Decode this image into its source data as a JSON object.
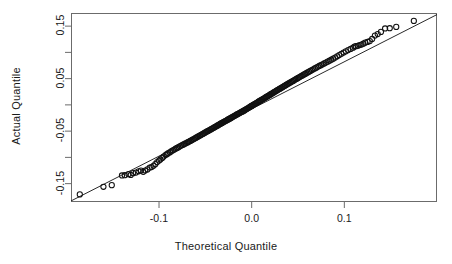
{
  "chart_data": {
    "type": "scatter",
    "title": "",
    "subtitle": "",
    "xlabel": "Theoretical Quantile",
    "ylabel": "Actual Quantile",
    "xlim": [
      -0.195,
      0.2
    ],
    "ylim": [
      -0.185,
      0.175
    ],
    "grid": false,
    "legend": null,
    "x_ticks": [
      {
        "value": -0.1,
        "label": "-0.1"
      },
      {
        "value": 0.0,
        "label": "0.0"
      },
      {
        "value": 0.1,
        "label": "0.1"
      }
    ],
    "y_ticks": [
      {
        "value": 0.15,
        "label": "0.15"
      },
      {
        "value": 0.1,
        "label": ""
      },
      {
        "value": 0.05,
        "label": "0.05"
      },
      {
        "value": 0.0,
        "label": ""
      },
      {
        "value": -0.05,
        "label": "-0.05"
      },
      {
        "value": -0.1,
        "label": ""
      },
      {
        "value": -0.15,
        "label": "-0.15"
      }
    ],
    "marker": {
      "shape": "open-circle",
      "radius": 2.6,
      "stroke": "#111111",
      "fill": "none"
    },
    "reference_line": {
      "x0": -0.195,
      "y0": -0.183,
      "x1": 0.2,
      "y1": 0.172,
      "color": "#111111",
      "width": 0.9
    },
    "series": [
      {
        "name": "quantiles",
        "points": [
          [
            -0.1855,
            -0.1705
          ],
          [
            -0.16,
            -0.156
          ],
          [
            -0.151,
            -0.153
          ],
          [
            -0.14,
            -0.1345
          ],
          [
            -0.137,
            -0.134
          ],
          [
            -0.133,
            -0.132
          ],
          [
            -0.1305,
            -0.1335
          ],
          [
            -0.128,
            -0.13
          ],
          [
            -0.125,
            -0.129
          ],
          [
            -0.122,
            -0.1265
          ],
          [
            -0.1195,
            -0.125
          ],
          [
            -0.117,
            -0.1275
          ],
          [
            -0.115,
            -0.125
          ],
          [
            -0.1125,
            -0.123
          ],
          [
            -0.11,
            -0.1195
          ],
          [
            -0.108,
            -0.1185
          ],
          [
            -0.106,
            -0.116
          ],
          [
            -0.104,
            -0.113
          ],
          [
            -0.102,
            -0.109
          ],
          [
            -0.1,
            -0.106
          ],
          [
            -0.0985,
            -0.104
          ],
          [
            -0.0965,
            -0.101
          ],
          [
            -0.095,
            -0.0985
          ],
          [
            -0.093,
            -0.0955
          ],
          [
            -0.0915,
            -0.094
          ],
          [
            -0.09,
            -0.092
          ],
          [
            -0.088,
            -0.09
          ],
          [
            -0.0865,
            -0.088
          ],
          [
            -0.085,
            -0.0865
          ],
          [
            -0.0835,
            -0.085
          ],
          [
            -0.082,
            -0.0835
          ],
          [
            -0.0805,
            -0.082
          ],
          [
            -0.079,
            -0.0805
          ],
          [
            -0.0775,
            -0.079
          ],
          [
            -0.076,
            -0.0775
          ],
          [
            -0.0745,
            -0.0762
          ],
          [
            -0.073,
            -0.0748
          ],
          [
            -0.0715,
            -0.0735
          ],
          [
            -0.07,
            -0.0722
          ],
          [
            -0.0688,
            -0.071
          ],
          [
            -0.0675,
            -0.0698
          ],
          [
            -0.0662,
            -0.0686
          ],
          [
            -0.065,
            -0.0674
          ],
          [
            -0.0638,
            -0.0662
          ],
          [
            -0.0625,
            -0.065
          ],
          [
            -0.0612,
            -0.0638
          ],
          [
            -0.06,
            -0.0626
          ],
          [
            -0.0588,
            -0.0614
          ],
          [
            -0.0576,
            -0.0602
          ],
          [
            -0.0564,
            -0.059
          ],
          [
            -0.0552,
            -0.0578
          ],
          [
            -0.054,
            -0.0566
          ],
          [
            -0.0528,
            -0.0554
          ],
          [
            -0.0516,
            -0.0542
          ],
          [
            -0.0505,
            -0.053
          ],
          [
            -0.0493,
            -0.0518
          ],
          [
            -0.0482,
            -0.0507
          ],
          [
            -0.047,
            -0.0496
          ],
          [
            -0.0459,
            -0.0485
          ],
          [
            -0.0448,
            -0.0474
          ],
          [
            -0.0437,
            -0.0463
          ],
          [
            -0.0426,
            -0.0452
          ],
          [
            -0.0415,
            -0.0441
          ],
          [
            -0.0404,
            -0.043
          ],
          [
            -0.0393,
            -0.0419
          ],
          [
            -0.0382,
            -0.0408
          ],
          [
            -0.0372,
            -0.0397
          ],
          [
            -0.0361,
            -0.0386
          ],
          [
            -0.035,
            -0.0375
          ],
          [
            -0.034,
            -0.0364
          ],
          [
            -0.033,
            -0.0353
          ],
          [
            -0.0319,
            -0.0343
          ],
          [
            -0.0309,
            -0.0333
          ],
          [
            -0.0299,
            -0.0323
          ],
          [
            -0.0289,
            -0.0313
          ],
          [
            -0.0279,
            -0.0303
          ],
          [
            -0.0268,
            -0.0293
          ],
          [
            -0.0258,
            -0.0283
          ],
          [
            -0.0248,
            -0.0273
          ],
          [
            -0.0238,
            -0.0263
          ],
          [
            -0.0228,
            -0.0253
          ],
          [
            -0.0219,
            -0.0243
          ],
          [
            -0.0209,
            -0.0233
          ],
          [
            -0.0199,
            -0.0223
          ],
          [
            -0.0189,
            -0.0213
          ],
          [
            -0.018,
            -0.0203
          ],
          [
            -0.017,
            -0.0193
          ],
          [
            -0.016,
            -0.0183
          ],
          [
            -0.0151,
            -0.0174
          ],
          [
            -0.0141,
            -0.0165
          ],
          [
            -0.0132,
            -0.0156
          ],
          [
            -0.0122,
            -0.0147
          ],
          [
            -0.0113,
            -0.0138
          ],
          [
            -0.0103,
            -0.0129
          ],
          [
            -0.0094,
            -0.012
          ],
          [
            -0.0084,
            -0.011
          ],
          [
            -0.0075,
            -0.01
          ],
          [
            -0.0066,
            -0.009
          ],
          [
            -0.0056,
            -0.008
          ],
          [
            -0.0047,
            -0.007
          ],
          [
            -0.0038,
            -0.006
          ],
          [
            -0.0028,
            -0.005
          ],
          [
            -0.0019,
            -0.004
          ],
          [
            -0.001,
            -0.003
          ],
          [
            -0.0001,
            -0.002
          ],
          [
            0.0009,
            -0.001
          ],
          [
            0.0018,
            0.0
          ],
          [
            0.0027,
            0.001
          ],
          [
            0.0037,
            0.002
          ],
          [
            0.0046,
            0.003
          ],
          [
            0.0055,
            0.004
          ],
          [
            0.0065,
            0.005
          ],
          [
            0.0074,
            0.006
          ],
          [
            0.0083,
            0.007
          ],
          [
            0.0093,
            0.008
          ],
          [
            0.0102,
            0.009
          ],
          [
            0.0112,
            0.01
          ],
          [
            0.0121,
            0.011
          ],
          [
            0.0131,
            0.012
          ],
          [
            0.014,
            0.0131
          ],
          [
            0.015,
            0.0141
          ],
          [
            0.0159,
            0.0152
          ],
          [
            0.0169,
            0.0162
          ],
          [
            0.0179,
            0.0173
          ],
          [
            0.0189,
            0.0183
          ],
          [
            0.0198,
            0.0194
          ],
          [
            0.0208,
            0.0204
          ],
          [
            0.0218,
            0.0215
          ],
          [
            0.0228,
            0.0226
          ],
          [
            0.0238,
            0.0237
          ],
          [
            0.0248,
            0.0248
          ],
          [
            0.0258,
            0.0259
          ],
          [
            0.0269,
            0.027
          ],
          [
            0.0279,
            0.0281
          ],
          [
            0.0289,
            0.0292
          ],
          [
            0.03,
            0.0303
          ],
          [
            0.031,
            0.0314
          ],
          [
            0.0321,
            0.0326
          ],
          [
            0.0332,
            0.0337
          ],
          [
            0.0343,
            0.0349
          ],
          [
            0.0354,
            0.036
          ],
          [
            0.0365,
            0.0372
          ],
          [
            0.0376,
            0.0384
          ],
          [
            0.0387,
            0.0396
          ],
          [
            0.0399,
            0.0408
          ],
          [
            0.041,
            0.042
          ],
          [
            0.0422,
            0.0432
          ],
          [
            0.0434,
            0.0444
          ],
          [
            0.0446,
            0.0457
          ],
          [
            0.0458,
            0.0469
          ],
          [
            0.047,
            0.0482
          ],
          [
            0.0483,
            0.0495
          ],
          [
            0.0496,
            0.0508
          ],
          [
            0.0508,
            0.0521
          ],
          [
            0.0521,
            0.0534
          ],
          [
            0.0535,
            0.0548
          ],
          [
            0.0548,
            0.0561
          ],
          [
            0.0562,
            0.0575
          ],
          [
            0.0576,
            0.0589
          ],
          [
            0.059,
            0.0603
          ],
          [
            0.0604,
            0.0618
          ],
          [
            0.0619,
            0.0632
          ],
          [
            0.0634,
            0.0647
          ],
          [
            0.0649,
            0.0662
          ],
          [
            0.0665,
            0.0678
          ],
          [
            0.0681,
            0.0693
          ],
          [
            0.0697,
            0.0709
          ],
          [
            0.0713,
            0.0725
          ],
          [
            0.073,
            0.0741
          ],
          [
            0.0747,
            0.0757
          ],
          [
            0.0765,
            0.0773
          ],
          [
            0.0783,
            0.0789
          ],
          [
            0.0801,
            0.0806
          ],
          [
            0.082,
            0.0823
          ],
          [
            0.084,
            0.0841
          ],
          [
            0.086,
            0.086
          ],
          [
            0.088,
            0.088
          ],
          [
            0.0901,
            0.0901
          ],
          [
            0.0923,
            0.0924
          ],
          [
            0.0945,
            0.0948
          ],
          [
            0.0968,
            0.0972
          ],
          [
            0.0992,
            0.0997
          ],
          [
            0.1016,
            0.102
          ],
          [
            0.1042,
            0.1043
          ],
          [
            0.1068,
            0.1066
          ],
          [
            0.1095,
            0.109
          ],
          [
            0.111,
            0.111
          ],
          [
            0.1125,
            0.1118
          ],
          [
            0.1145,
            0.1125
          ],
          [
            0.1165,
            0.114
          ],
          [
            0.1185,
            0.115
          ],
          [
            0.1205,
            0.1165
          ],
          [
            0.1225,
            0.1185
          ],
          [
            0.125,
            0.12
          ],
          [
            0.1275,
            0.1215
          ],
          [
            0.13,
            0.1255
          ],
          [
            0.133,
            0.132
          ],
          [
            0.136,
            0.135
          ],
          [
            0.1395,
            0.139
          ],
          [
            0.144,
            0.1455
          ],
          [
            0.149,
            0.146
          ],
          [
            0.156,
            0.1485
          ],
          [
            0.175,
            0.16
          ]
        ]
      }
    ]
  },
  "axes": {
    "x_title": "Theoretical Quantile",
    "y_title": "Actual Quantile"
  }
}
